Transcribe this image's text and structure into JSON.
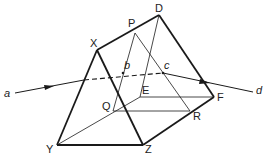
{
  "diagram": {
    "type": "prism-ray-path",
    "stroke_color": "#1a1a1a",
    "background": "#ffffff",
    "vertices": {
      "X": {
        "label": "X",
        "x": 97,
        "y": 50
      },
      "P": {
        "label": "P",
        "x": 135,
        "y": 33
      },
      "D": {
        "label": "D",
        "x": 159,
        "y": 15
      },
      "E": {
        "label": "E",
        "x": 140,
        "y": 97
      },
      "F": {
        "label": "F",
        "x": 214,
        "y": 97
      },
      "Q": {
        "label": "Q",
        "x": 113,
        "y": 111
      },
      "R": {
        "label": "R",
        "x": 190,
        "y": 111
      },
      "Y": {
        "label": "Y",
        "x": 57,
        "y": 145
      },
      "Z": {
        "label": "Z",
        "x": 143,
        "y": 145
      }
    },
    "ray_points": {
      "a": {
        "label": "a",
        "x": 15,
        "y": 93
      },
      "b": {
        "label": "b",
        "x": 123,
        "y": 73
      },
      "c": {
        "label": "c",
        "x": 163,
        "y": 73
      },
      "d": {
        "label": "d",
        "x": 253,
        "y": 92
      }
    },
    "labels": {
      "X": "X",
      "P": "P",
      "D": "D",
      "E": "E",
      "F": "F",
      "Q": "Q",
      "R": "R",
      "Y": "Y",
      "Z": "Z",
      "a": "a",
      "b": "b",
      "c": "c",
      "d": "d"
    }
  }
}
